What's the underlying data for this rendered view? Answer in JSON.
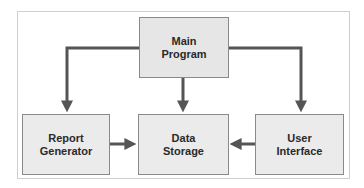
{
  "diagram": {
    "type": "block-diagram",
    "colors": {
      "box_fill": "#ebebeb",
      "box_border": "#8a8a8a",
      "connector": "#555555",
      "frame_border": "#cfcfcf",
      "text": "#2a2a2a"
    },
    "nodes": [
      {
        "id": "main",
        "lines": [
          "Main",
          "Program"
        ]
      },
      {
        "id": "report",
        "lines": [
          "Report",
          "Generator"
        ]
      },
      {
        "id": "data",
        "lines": [
          "Data",
          "Storage"
        ]
      },
      {
        "id": "user",
        "lines": [
          "User",
          "Interface"
        ]
      }
    ],
    "edges": [
      {
        "from": "main",
        "to": "report"
      },
      {
        "from": "main",
        "to": "data"
      },
      {
        "from": "main",
        "to": "user"
      },
      {
        "from": "report",
        "to": "data"
      },
      {
        "from": "user",
        "to": "data"
      }
    ]
  }
}
